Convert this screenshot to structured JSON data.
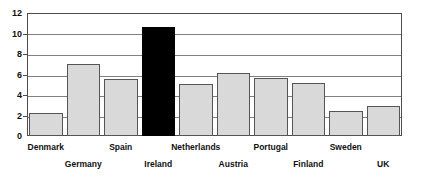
{
  "chart_data": {
    "type": "bar",
    "title": "",
    "subtitle": "",
    "xlabel": "",
    "ylabel": "",
    "ylim": [
      0,
      12
    ],
    "yticks": [
      0,
      2,
      4,
      6,
      8,
      10,
      12
    ],
    "ytick_labels": [
      "0",
      "2",
      "4",
      "6",
      "8",
      "10",
      "12"
    ],
    "grid": true,
    "legend": false,
    "legend_position": "none",
    "categories": [
      "Denmark",
      "Germany",
      "Spain",
      "Ireland",
      "Netherlands",
      "Austria",
      "Portugal",
      "Finland",
      "Sweden",
      "UK"
    ],
    "values": [
      2.2,
      7.0,
      5.6,
      10.6,
      5.1,
      6.1,
      5.7,
      5.2,
      2.4,
      2.9
    ],
    "highlight_index": 3,
    "colors": {
      "bar_fill": "#d9d9d9",
      "bar_border": "#555555",
      "highlight_fill": "#000000",
      "gridline": "#808080",
      "axis": "#4d4d4d",
      "text": "#111111",
      "background": "#ffffff"
    },
    "label_rows": [
      "top",
      "bottom",
      "top",
      "bottom",
      "top",
      "bottom",
      "top",
      "bottom",
      "top",
      "bottom"
    ]
  }
}
